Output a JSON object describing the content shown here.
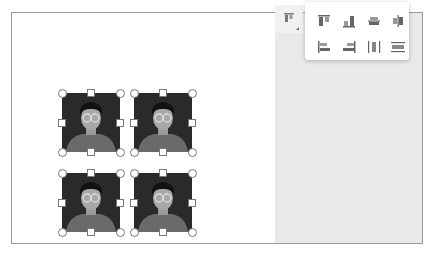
{
  "canvas": {
    "images": [
      {
        "name": "avatar-image-1",
        "alt": "person-with-glasses avatar"
      },
      {
        "name": "avatar-image-2",
        "alt": "person-with-glasses avatar"
      },
      {
        "name": "avatar-image-3",
        "alt": "person-with-glasses avatar"
      },
      {
        "name": "avatar-image-4",
        "alt": "person-with-glasses avatar"
      }
    ]
  },
  "toolbar": {
    "align_button": {
      "icon": "align-top-icon",
      "tooltip": ""
    },
    "align_menu": {
      "items": [
        {
          "icon": "align-top-icon"
        },
        {
          "icon": "align-bottom-icon"
        },
        {
          "icon": "align-middle-icon"
        },
        {
          "icon": "align-center-horizontal-icon"
        },
        {
          "icon": "align-left-icon"
        },
        {
          "icon": "align-right-icon"
        },
        {
          "icon": "distribute-horizontal-icon"
        },
        {
          "icon": "distribute-vertical-icon"
        }
      ]
    }
  },
  "colors": {
    "panel_gray": "#e9e9e9",
    "image_bg": "#2a2a2a",
    "icon_gray": "#666666"
  }
}
